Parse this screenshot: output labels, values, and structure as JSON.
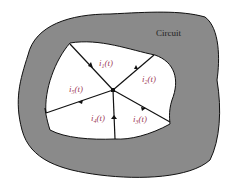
{
  "diagram": {
    "region_label": "Circuit",
    "node": "junction",
    "branches": [
      {
        "label": "i",
        "sub": "1",
        "arg": "(t)",
        "direction": "into-node"
      },
      {
        "label": "i",
        "sub": "2",
        "arg": "(t)",
        "direction": "out-of-node"
      },
      {
        "label": "i",
        "sub": "3",
        "arg": "(t)",
        "direction": "out-of-node"
      },
      {
        "label": "i",
        "sub": "4",
        "arg": "(t)",
        "direction": "into-node"
      },
      {
        "label": "i",
        "sub": "5",
        "arg": "(t)",
        "direction": "out-of-node"
      }
    ],
    "colors": {
      "circuit_fill": "#8a8a8a",
      "label": "#a0405a",
      "line": "#111111"
    }
  }
}
